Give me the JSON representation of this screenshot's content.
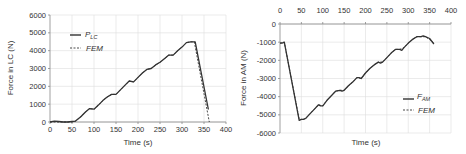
{
  "chart_data": [
    {
      "type": "line",
      "title": "",
      "xlabel": "Time (s)",
      "ylabel": "Force in LC (N)",
      "xlim": [
        0,
        400
      ],
      "ylim": [
        0,
        6000
      ],
      "xticks": [
        0,
        50,
        100,
        150,
        200,
        250,
        300,
        350,
        400
      ],
      "yticks": [
        0,
        1000,
        2000,
        3000,
        4000,
        5000,
        6000
      ],
      "grid": true,
      "legend_position": "upper-left",
      "series": [
        {
          "name": "P_LC",
          "label_main": "P",
          "label_sub": "LC",
          "style": "solid",
          "x": [
            0,
            10,
            20,
            30,
            40,
            50,
            58,
            70,
            80,
            90,
            100,
            110,
            120,
            130,
            140,
            150,
            160,
            170,
            180,
            190,
            200,
            210,
            220,
            230,
            240,
            250,
            260,
            270,
            280,
            290,
            300,
            310,
            320,
            330,
            360
          ],
          "y": [
            0,
            50,
            30,
            0,
            0,
            30,
            50,
            300,
            550,
            750,
            720,
            950,
            1200,
            1400,
            1550,
            1550,
            1800,
            2050,
            2300,
            2250,
            2500,
            2750,
            2950,
            3000,
            3200,
            3350,
            3550,
            3750,
            3750,
            4000,
            4200,
            4450,
            4500,
            4500,
            700
          ]
        },
        {
          "name": "FEM",
          "label_main": "FEM",
          "label_sub": "",
          "style": "dashed",
          "x": [
            0,
            50,
            58,
            70,
            80,
            90,
            100,
            110,
            120,
            130,
            140,
            150,
            160,
            170,
            180,
            190,
            200,
            210,
            220,
            230,
            240,
            250,
            260,
            270,
            280,
            290,
            300,
            310,
            320,
            328,
            362
          ],
          "y": [
            0,
            0,
            50,
            300,
            550,
            750,
            720,
            950,
            1200,
            1400,
            1550,
            1550,
            1800,
            2050,
            2300,
            2250,
            2500,
            2750,
            2950,
            3000,
            3200,
            3350,
            3550,
            3750,
            3750,
            4000,
            4200,
            4450,
            4500,
            4500,
            0
          ]
        }
      ]
    },
    {
      "type": "line",
      "title": "",
      "xlabel": "Time (s)",
      "ylabel": "Force in AM (N)",
      "xlim": [
        0,
        400
      ],
      "ylim": [
        -6000,
        0
      ],
      "xticks": [
        0,
        50,
        100,
        150,
        200,
        250,
        300,
        350,
        400
      ],
      "yticks": [
        0,
        -1000,
        -2000,
        -3000,
        -4000,
        -5000,
        -6000
      ],
      "x_axis_position": "top",
      "grid": true,
      "legend_position": "lower-right",
      "series": [
        {
          "name": "F_AM",
          "label_main": "F",
          "label_sub": "AM",
          "style": "solid",
          "x": [
            0,
            5,
            10,
            45,
            50,
            55,
            60,
            70,
            80,
            90,
            95,
            100,
            110,
            120,
            130,
            140,
            145,
            150,
            160,
            170,
            180,
            185,
            190,
            200,
            210,
            220,
            230,
            235,
            240,
            250,
            260,
            270,
            280,
            285,
            290,
            300,
            310,
            320,
            330,
            335,
            340,
            350,
            360
          ],
          "y": [
            -1050,
            -1050,
            -1000,
            -5300,
            -5250,
            -5250,
            -5200,
            -4950,
            -4700,
            -4450,
            -4500,
            -4500,
            -4200,
            -3950,
            -3700,
            -3650,
            -3700,
            -3650,
            -3400,
            -3200,
            -2950,
            -2950,
            -3000,
            -2700,
            -2450,
            -2250,
            -2100,
            -2150,
            -2100,
            -1850,
            -1600,
            -1400,
            -1400,
            -1450,
            -1300,
            -1050,
            -850,
            -700,
            -700,
            -650,
            -700,
            -800,
            -1100
          ]
        },
        {
          "name": "FEM",
          "label_main": "FEM",
          "label_sub": "",
          "style": "dashed",
          "x": [
            0,
            10,
            45,
            50,
            60,
            70,
            80,
            90,
            100,
            110,
            120,
            130,
            140,
            150,
            160,
            170,
            180,
            190,
            200,
            210,
            220,
            230,
            240,
            250,
            260,
            270,
            280,
            290,
            300,
            310,
            320,
            330,
            340,
            350,
            360
          ],
          "y": [
            -1050,
            -1000,
            -5250,
            -5250,
            -5200,
            -4950,
            -4700,
            -4450,
            -4500,
            -4200,
            -3950,
            -3700,
            -3650,
            -3650,
            -3400,
            -3200,
            -2950,
            -3000,
            -2700,
            -2450,
            -2250,
            -2100,
            -2100,
            -1850,
            -1600,
            -1400,
            -1400,
            -1300,
            -1050,
            -850,
            -700,
            -700,
            -700,
            -850,
            -1050
          ]
        }
      ]
    }
  ],
  "charts": [
    {
      "xlabel": "Time (s)",
      "ylabel": "Force in LC (N)",
      "legend": [
        {
          "main": "P",
          "sub": "LC"
        },
        {
          "main": "FEM",
          "sub": ""
        }
      ]
    },
    {
      "xlabel": "Time (s)",
      "ylabel": "Force in AM (N)",
      "legend": [
        {
          "main": "F",
          "sub": "AM"
        },
        {
          "main": "FEM",
          "sub": ""
        }
      ]
    }
  ],
  "colors": {
    "line": "#333333",
    "grid": "#dddddd",
    "axis": "#888888",
    "text": "#333333"
  }
}
